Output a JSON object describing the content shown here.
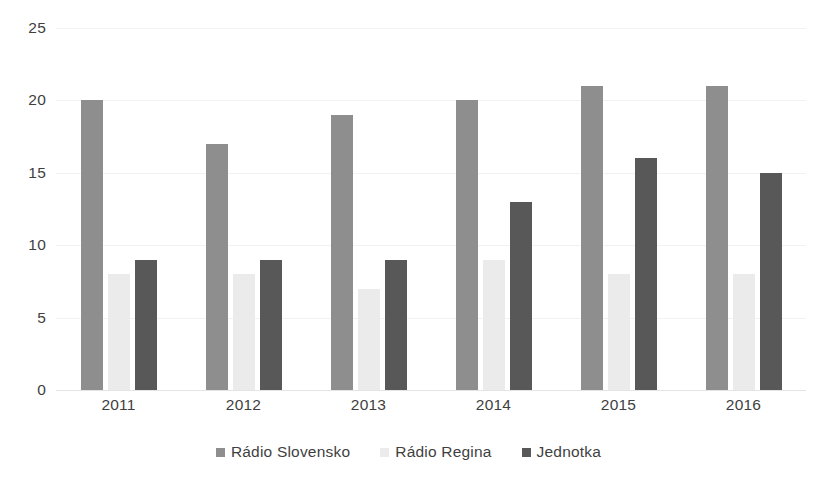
{
  "chart_data": {
    "type": "bar",
    "title": "",
    "subtitle": "",
    "xlabel": "",
    "ylabel": "",
    "categories": [
      "2011",
      "2012",
      "2013",
      "2014",
      "2015",
      "2016"
    ],
    "series": [
      {
        "name": "Rádio Slovensko",
        "color": "#8e8e8e",
        "values": [
          20,
          17,
          19,
          20,
          21,
          21
        ]
      },
      {
        "name": "Rádio Regina",
        "color": "#ebebeb",
        "values": [
          8,
          8,
          7,
          9,
          8,
          8
        ]
      },
      {
        "name": "Jednotka",
        "color": "#585858",
        "values": [
          9,
          9,
          9,
          13,
          16,
          15
        ]
      }
    ],
    "ylim": [
      0,
      25
    ],
    "ytick_values": [
      0,
      5,
      10,
      15,
      20,
      25
    ],
    "ytick_labels": [
      "0",
      "5",
      "10",
      "15",
      "20",
      "25"
    ],
    "grid": true,
    "grid_axis": "y",
    "legend_position": "bottom",
    "background_color": "#ffffff"
  }
}
